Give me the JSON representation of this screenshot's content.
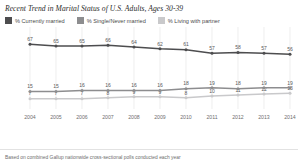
{
  "title": "Recent Trend in Marital Status of U.S. Adults, Ages 30-39",
  "footnote": "Based on combined Gallup nationwide cross-sectional polls conducted each year",
  "legend": [
    {
      "label": "% Currently married",
      "color": "#4d4d4f",
      "swatch_name": "legend-swatch-currently-married"
    },
    {
      "label": "% Single/Never married",
      "color": "#8d8d8f",
      "swatch_name": "legend-swatch-single-never-married"
    },
    {
      "label": "% Living with partner",
      "color": "#c9c9cb",
      "swatch_name": "legend-swatch-living-with-partner"
    }
  ],
  "chart_data": {
    "type": "line",
    "title": "Recent Trend in Marital Status of U.S. Adults, Ages 30-39",
    "xlabel": "",
    "ylabel": "",
    "ylim": [
      0,
      75
    ],
    "grid": true,
    "legend_position": "top-left",
    "categories": [
      "2004",
      "2005",
      "2006",
      "2007",
      "2008",
      "2009",
      "2010",
      "2011",
      "2012",
      "2013",
      "2014"
    ],
    "series": [
      {
        "name": "% Currently married",
        "color": "#4d4d4f",
        "values": [
          67,
          65,
          65,
          66,
          64,
          62,
          61,
          57,
          58,
          57,
          56
        ]
      },
      {
        "name": "% Single/Never married",
        "color": "#8d8d8f",
        "values": [
          15,
          15,
          16,
          16,
          16,
          16,
          18,
          19,
          18,
          19,
          19
        ]
      },
      {
        "name": "% Living with partner",
        "color": "#c9c9cb",
        "values": [
          7,
          7,
          7,
          8,
          9,
          9,
          8,
          10,
          11,
          12,
          13
        ]
      }
    ]
  }
}
